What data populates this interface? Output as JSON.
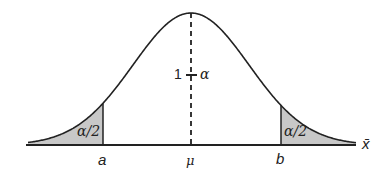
{
  "diagram": {
    "curve": {
      "type": "normal-density",
      "mean_x": 191,
      "sigma_px": 58,
      "peak_y": 13,
      "baseline_y": 145,
      "x_start": 28,
      "x_end": 356
    },
    "colors": {
      "stroke": "#222222",
      "shade": "#c8c8c8",
      "background": "#ffffff"
    },
    "labels": {
      "center_area": "1 − α",
      "center_area_one": "1",
      "center_area_alpha": "α",
      "left_tail": "α/2",
      "right_tail": "α/2",
      "a": "a",
      "mu": "μ",
      "b": "b",
      "x_axis": "x̄"
    },
    "markers": {
      "a_x": 103,
      "mu_x": 191,
      "b_x": 281
    }
  }
}
